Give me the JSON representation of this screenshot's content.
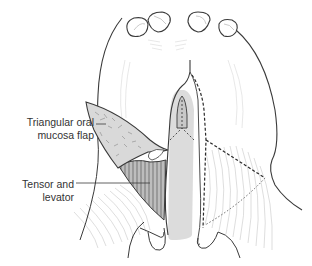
{
  "figure": {
    "type": "anatomical illustration",
    "labels": [
      {
        "id": "flap",
        "line1": "Triangular oral",
        "line2": "mucosa flap"
      },
      {
        "id": "tensor",
        "line1": "Tensor and",
        "line2": "levator"
      }
    ],
    "colors": {
      "outline": "#3a3a3a",
      "flap_fill": "#d9d9d9",
      "muscle_fill": "#bdbdbd",
      "cleft_fill": "#dcdcdc",
      "fiber_lines": "#bfbfbf",
      "label_text": "#333333"
    },
    "teeth_count": 4
  }
}
